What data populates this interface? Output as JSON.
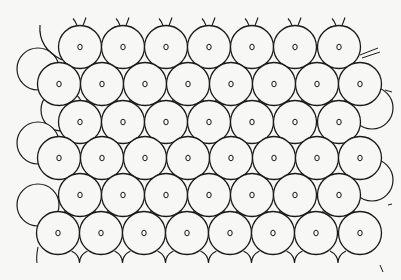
{
  "figure": {
    "background": "#f7f7f5",
    "stroke": "#1a1a1a",
    "fill": "#f7f7f5",
    "radius": 21.5,
    "nucleus_rx": 2.2,
    "nucleus_ry": 2.8,
    "rows": [
      {
        "y": 47,
        "xs": [
          80,
          123,
          166,
          209,
          252,
          295,
          339
        ]
      },
      {
        "y": 84,
        "xs": [
          59,
          102,
          145,
          188,
          231,
          274,
          317,
          360
        ]
      },
      {
        "y": 122,
        "xs": [
          80,
          123,
          166,
          209,
          252,
          295,
          339
        ]
      },
      {
        "y": 158,
        "xs": [
          59,
          102,
          145,
          188,
          231,
          274,
          317,
          360
        ]
      },
      {
        "y": 195,
        "xs": [
          80,
          123,
          166,
          209,
          252,
          295,
          339
        ]
      },
      {
        "y": 233,
        "xs": [
          58,
          101,
          144,
          187,
          230,
          273,
          316,
          360
        ]
      }
    ],
    "left_partial_circles": [
      {
        "cx": 38,
        "cy": 69,
        "r": 21
      },
      {
        "cx": 62,
        "cy": 110,
        "r": 21
      },
      {
        "cx": 38,
        "cy": 143,
        "r": 21
      },
      {
        "cx": 38,
        "cy": 205,
        "r": 21
      }
    ],
    "right_partial_circles": [
      {
        "cx": 160,
        "cy": 0,
        "r": 0
      }
    ]
  }
}
